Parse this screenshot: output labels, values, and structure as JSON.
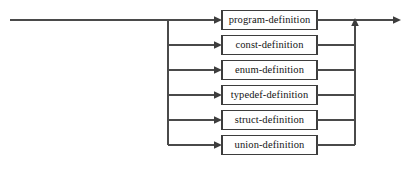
{
  "diagram": {
    "type": "railroad-syntax-diagram",
    "name": "definition",
    "colors": {
      "line": "#4a4a4a",
      "box_stroke": "#3d3d3d",
      "box_fill": "#ffffff",
      "text": "#141414",
      "background": "#ffffff"
    },
    "geometry": {
      "width": 411,
      "height": 192,
      "entry_x": 10,
      "branch_bus_x": 168,
      "box_left": 222,
      "box_right": 317,
      "merge_bus_x": 355,
      "exit_x": 400,
      "box_height": 19,
      "row_pitch": 25,
      "first_row_y": 20
    },
    "alternatives": [
      {
        "label": "program-definition",
        "row": 0,
        "y": 20
      },
      {
        "label": "const-definition",
        "row": 1,
        "y": 45
      },
      {
        "label": "enum-definition",
        "row": 2,
        "y": 70
      },
      {
        "label": "typedef-definition",
        "row": 3,
        "y": 95
      },
      {
        "label": "struct-definition",
        "row": 4,
        "y": 120
      },
      {
        "label": "union-definition",
        "row": 5,
        "y": 145
      }
    ],
    "arrows": {
      "entry_into_boxes": "right-pointing",
      "merge_up": "up-pointing",
      "exit": "right-pointing"
    }
  }
}
